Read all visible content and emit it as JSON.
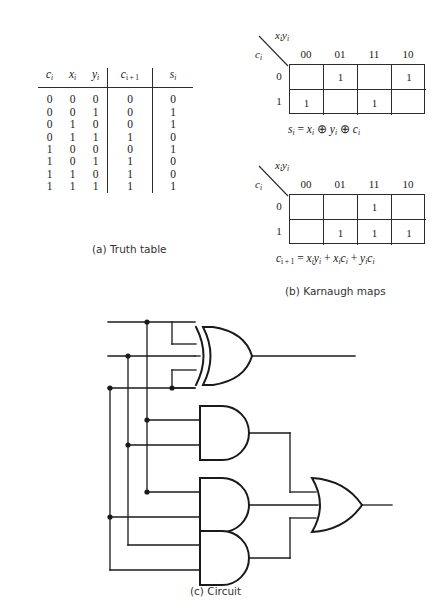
{
  "figure": {
    "captions": {
      "a": "(a) Truth table",
      "b": "(b) Karnaugh maps",
      "c": "(c) Circuit"
    }
  },
  "truth_table": {
    "headers": [
      "c",
      "x",
      "y",
      "c",
      "s"
    ],
    "header_subs": [
      "i",
      "i",
      "i",
      "i + 1",
      "i"
    ],
    "rows": [
      {
        "ci": "0",
        "xi": "0",
        "yi": "0",
        "cout": "0",
        "si": "0"
      },
      {
        "ci": "0",
        "xi": "0",
        "yi": "1",
        "cout": "0",
        "si": "1"
      },
      {
        "ci": "0",
        "xi": "1",
        "yi": "0",
        "cout": "0",
        "si": "1"
      },
      {
        "ci": "0",
        "xi": "1",
        "yi": "1",
        "cout": "1",
        "si": "0"
      },
      {
        "ci": "1",
        "xi": "0",
        "yi": "0",
        "cout": "0",
        "si": "1"
      },
      {
        "ci": "1",
        "xi": "0",
        "yi": "1",
        "cout": "1",
        "si": "0"
      },
      {
        "ci": "1",
        "xi": "1",
        "yi": "0",
        "cout": "1",
        "si": "0"
      },
      {
        "ci": "1",
        "xi": "1",
        "yi": "1",
        "cout": "1",
        "si": "1"
      }
    ]
  },
  "kmaps": [
    {
      "name": "sum-kmap",
      "col_var": "xiyi",
      "row_var": "ci",
      "col_headers": [
        "00",
        "01",
        "11",
        "10"
      ],
      "row_headers": [
        "0",
        "1"
      ],
      "cells": [
        [
          "",
          "1",
          "",
          "1"
        ],
        [
          "1",
          "",
          "1",
          ""
        ]
      ],
      "equation": "si = xi ⊕ yi ⊕ ci"
    },
    {
      "name": "carry-kmap",
      "col_var": "xiyi",
      "row_var": "ci",
      "col_headers": [
        "00",
        "01",
        "11",
        "10"
      ],
      "row_headers": [
        "0",
        "1"
      ],
      "cells": [
        [
          "",
          "",
          "1",
          ""
        ],
        [
          "",
          "1",
          "1",
          "1"
        ]
      ],
      "equation": "ci+1 = xiyi + xici + yici"
    }
  ],
  "circuit": {
    "inputs": [
      "x",
      "y",
      "c"
    ],
    "input_subs": [
      "i",
      "i",
      "i"
    ],
    "outputs": [
      {
        "label": "s",
        "sub": "i"
      },
      {
        "label": "c",
        "sub": "i + 1"
      }
    ],
    "gates": [
      {
        "type": "xor",
        "inputs": 3,
        "output": "s_i"
      },
      {
        "type": "and",
        "inputs": 2,
        "output": "x_i y_i"
      },
      {
        "type": "and",
        "inputs": 2,
        "output": "x_i c_i"
      },
      {
        "type": "and",
        "inputs": 2,
        "output": "y_i c_i"
      },
      {
        "type": "or",
        "inputs": 3,
        "output": "c_i+1"
      }
    ]
  },
  "colors": {
    "ink": "#2b2b2b",
    "background": "#ffffff",
    "caption": "#333333"
  }
}
